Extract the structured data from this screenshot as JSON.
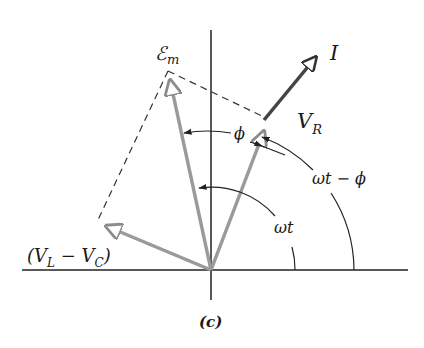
{
  "figure": {
    "caption": "(c)",
    "type": "phasor diagram",
    "colors": {
      "axes": "#222222",
      "phasor_gray": "#9a9a9a",
      "current": "#444444",
      "dashed": "#333333",
      "background": "#ffffff"
    }
  },
  "labels": {
    "emf": "ℰ",
    "emf_sub": "m",
    "current": "I",
    "vr_main": "V",
    "vr_sub": "R",
    "vlvc_open": "(V",
    "vlvc_sub1": "L",
    "vlvc_minus": " − V",
    "vlvc_sub2": "C",
    "vlvc_close": ")",
    "phi": "ϕ",
    "omega_t": "ωt",
    "omega_t_minus_phi": "ωt − ϕ"
  },
  "phasors": [
    {
      "name": "Em",
      "from": [
        211,
        270
      ],
      "to": [
        168,
        72
      ]
    },
    {
      "name": "VR",
      "from": [
        211,
        270
      ],
      "to": [
        266,
        125
      ]
    },
    {
      "name": "I",
      "from": [
        266,
        118
      ],
      "to": [
        320,
        52
      ]
    },
    {
      "name": "VL-VC",
      "from": [
        211,
        270
      ],
      "to": [
        98,
        222
      ]
    }
  ]
}
